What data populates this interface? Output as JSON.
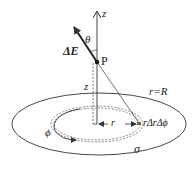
{
  "diagram": {
    "labels": {
      "z_axis": "z",
      "theta": "θ",
      "delta_e": "ΔE",
      "point_p": "P",
      "z_height": "z",
      "disk_edge": "r=R",
      "radius": "r",
      "area_element": "rΔrΔϕ",
      "phi": "ϕ",
      "sigma": "σ"
    },
    "colors": {
      "stroke": "#333333",
      "dash": "#555555",
      "text": "#222222"
    }
  }
}
